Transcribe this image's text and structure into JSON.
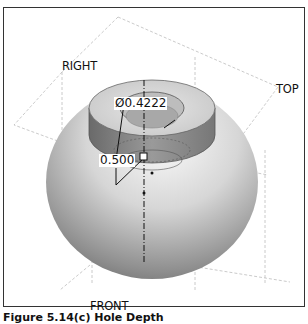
{
  "viewport": {
    "plane_labels": {
      "right": "RIGHT",
      "top": "TOP",
      "front": "FRONT"
    },
    "dimensions": {
      "hole_diameter": "Ø0.4222",
      "hole_depth": "0.500"
    }
  },
  "caption": "Figure 5.14(c) Hole Depth",
  "colors": {
    "background": "#ffffff",
    "frame_border": "#333333",
    "plane_lines": "#b8b8b8",
    "sphere_light": "#f4f4f4",
    "sphere_dark": "#7a7a7a"
  }
}
